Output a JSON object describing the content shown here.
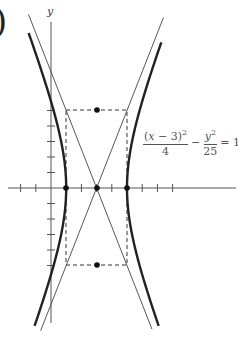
{
  "figure": {
    "label_fragment": ")",
    "y_axis_label": "y",
    "equation": {
      "term1_num_prefix": "(",
      "term1_num_var": "x",
      "term1_num_rest": " − 3)",
      "term1_num_exp": "2",
      "term1_den": "4",
      "minus": "−",
      "term2_num_var": "y",
      "term2_num_exp": "2",
      "term2_den": "25",
      "equals": "= 1"
    }
  },
  "chart_data": {
    "type": "line",
    "title": "",
    "xlabel": "",
    "ylabel": "y",
    "equation_text": "(x − 3)^2/4 − y^2/25 = 1",
    "center": [
      3,
      0
    ],
    "a": 2,
    "b": 5,
    "vertices": [
      [
        1,
        0
      ],
      [
        5,
        0
      ]
    ],
    "co_vertices": [
      [
        3,
        5
      ],
      [
        3,
        -5
      ]
    ],
    "asymptotes": [
      "y = (5/2)(x − 3)",
      "y = −(5/2)(x − 3)"
    ],
    "fundamental_rectangle": {
      "x": [
        1,
        5
      ],
      "y": [
        -5,
        5
      ],
      "style": "dashed"
    },
    "marked_points": [
      [
        1,
        0
      ],
      [
        3,
        0
      ],
      [
        5,
        0
      ],
      [
        3,
        5
      ],
      [
        3,
        -5
      ]
    ],
    "x_ticks": [
      -2,
      -1,
      1,
      2,
      3,
      4,
      5,
      6,
      7,
      8
    ],
    "y_ticks": [
      -5,
      -4,
      -3,
      -2,
      -1,
      1,
      2,
      3,
      4,
      5
    ],
    "xlim": [
      -2.8,
      12
    ],
    "ylim": [
      -8.8,
      10.8
    ],
    "grid": false,
    "series": [
      {
        "name": "left branch",
        "style": "thick"
      },
      {
        "name": "right branch",
        "style": "thick"
      },
      {
        "name": "asymptote 1",
        "style": "thin"
      },
      {
        "name": "asymptote 2",
        "style": "thin"
      }
    ]
  }
}
